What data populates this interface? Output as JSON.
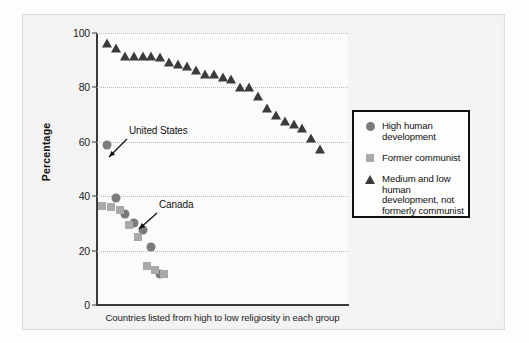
{
  "figure": {
    "y_axis_title": "Percentage",
    "x_caption": "Countries listed from high to low religiosity in each group"
  },
  "legend": {
    "items": [
      {
        "label": "High human development",
        "marker": "circle-marker-icon",
        "color": "#7b7b7b"
      },
      {
        "label": "Former communist",
        "marker": "square-marker-icon",
        "color": "#a9a9a9"
      },
      {
        "label": "Medium and low human development, not formerly communist",
        "marker": "triangle-marker-icon",
        "color": "#3b3b3b"
      }
    ]
  },
  "annotations": [
    {
      "text": "United States",
      "target_value": 59
    },
    {
      "text": "Canada",
      "target_value": 33
    }
  ],
  "chart_data": {
    "type": "scatter",
    "title": "",
    "xlabel": "Countries listed from high to low religiosity in each group",
    "ylabel": "Percentage",
    "ylim": [
      0,
      100
    ],
    "yticks": [
      0,
      20,
      40,
      60,
      80,
      100
    ],
    "grid": "horizontal-dotted",
    "legend_position": "right",
    "series": [
      {
        "name": "High human development",
        "marker": "circle",
        "color": "#7b7b7b",
        "points": [
          {
            "x": 1,
            "y": 59,
            "label": "United States"
          },
          {
            "x": 2,
            "y": 39.5
          },
          {
            "x": 3,
            "y": 33.5,
            "label": "Canada"
          },
          {
            "x": 4,
            "y": 30
          },
          {
            "x": 5,
            "y": 27.5
          },
          {
            "x": 6,
            "y": 21.5
          },
          {
            "x": 7,
            "y": 11.5
          }
        ]
      },
      {
        "name": "Former communist",
        "marker": "square",
        "color": "#a9a9a9",
        "points": [
          {
            "x": 1,
            "y": 36.5
          },
          {
            "x": 2,
            "y": 36
          },
          {
            "x": 3,
            "y": 35
          },
          {
            "x": 4,
            "y": 29.5
          },
          {
            "x": 5,
            "y": 25
          },
          {
            "x": 6,
            "y": 14.5
          },
          {
            "x": 7,
            "y": 13
          },
          {
            "x": 8,
            "y": 11.5
          }
        ]
      },
      {
        "name": "Medium and low human development, not formerly communist",
        "marker": "triangle",
        "color": "#3b3b3b",
        "points": [
          {
            "x": 1,
            "y": 96.5
          },
          {
            "x": 2,
            "y": 94.5
          },
          {
            "x": 3,
            "y": 91.5
          },
          {
            "x": 4,
            "y": 91.5
          },
          {
            "x": 5,
            "y": 91.5
          },
          {
            "x": 6,
            "y": 91.5
          },
          {
            "x": 7,
            "y": 91
          },
          {
            "x": 8,
            "y": 89.5
          },
          {
            "x": 9,
            "y": 88.5
          },
          {
            "x": 10,
            "y": 88
          },
          {
            "x": 11,
            "y": 86.5
          },
          {
            "x": 12,
            "y": 85
          },
          {
            "x": 13,
            "y": 85
          },
          {
            "x": 14,
            "y": 84
          },
          {
            "x": 15,
            "y": 83
          },
          {
            "x": 16,
            "y": 80
          },
          {
            "x": 17,
            "y": 80
          },
          {
            "x": 18,
            "y": 77
          },
          {
            "x": 19,
            "y": 72.5
          },
          {
            "x": 20,
            "y": 70
          },
          {
            "x": 21,
            "y": 67.5
          },
          {
            "x": 22,
            "y": 66.5
          },
          {
            "x": 23,
            "y": 65
          },
          {
            "x": 24,
            "y": 61.5
          },
          {
            "x": 25,
            "y": 57.5
          }
        ]
      }
    ]
  }
}
